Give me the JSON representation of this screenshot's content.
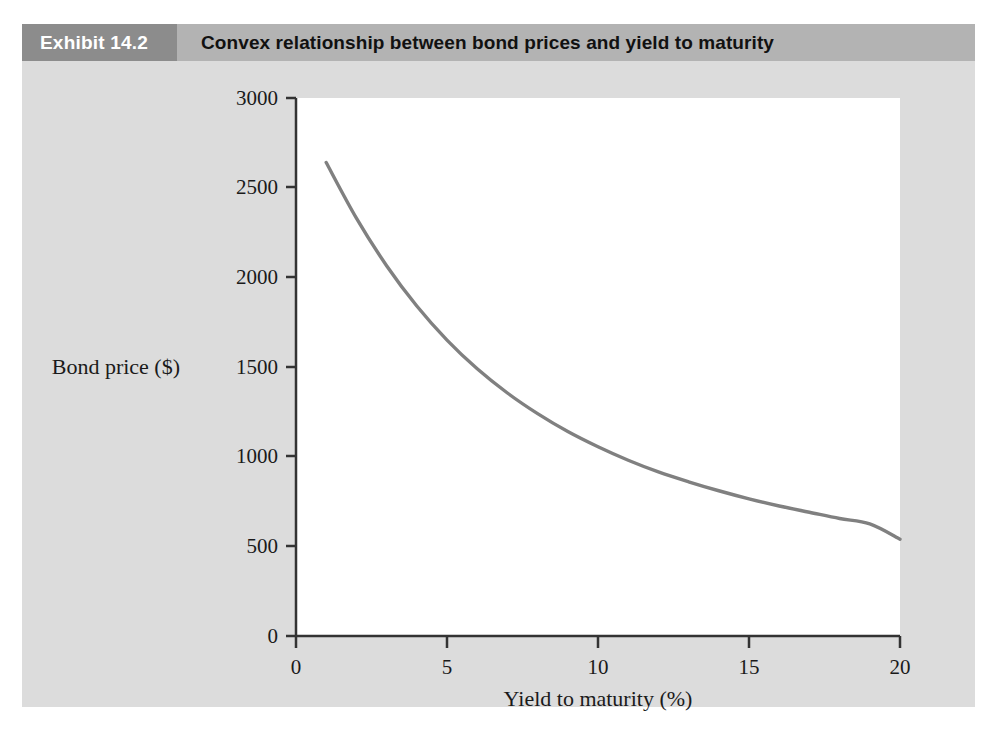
{
  "exhibit": {
    "tag": "Exhibit 14.2",
    "title": "Convex relationship between bond prices and yield to maturity"
  },
  "colors": {
    "panel_background": "#dcdcdc",
    "header_band": "#b3b3b3",
    "tag_block": "#8c8c8c",
    "plot_background": "#ffffff",
    "axis": "#333333",
    "curve": "#808080"
  },
  "chart_data": {
    "type": "line",
    "title": "Convex relationship between bond prices and yield to maturity",
    "xlabel": "Yield to maturity (%)",
    "ylabel": "Bond price ($)",
    "xlim": [
      0,
      20
    ],
    "ylim": [
      0,
      3000
    ],
    "xticks": [
      0,
      5,
      10,
      15,
      20
    ],
    "yticks": [
      0,
      500,
      1000,
      1500,
      2000,
      2500,
      3000
    ],
    "xtick_labels": [
      "0",
      "5",
      "10",
      "15",
      "20"
    ],
    "ytick_labels": [
      "0",
      "500",
      "1000",
      "1500",
      "2000",
      "2500",
      "3000"
    ],
    "grid": false,
    "legend": null,
    "series": [
      {
        "name": "Bond price",
        "color": "#808080",
        "x": [
          1,
          2,
          3,
          4,
          5,
          6,
          7,
          8,
          9,
          10,
          11,
          12,
          13,
          14,
          15,
          16,
          17,
          18,
          19,
          20
        ],
        "values": [
          2640,
          2330,
          2065,
          1840,
          1650,
          1490,
          1355,
          1240,
          1140,
          1055,
          980,
          915,
          860,
          810,
          765,
          725,
          690,
          655,
          625,
          540
        ]
      }
    ]
  }
}
